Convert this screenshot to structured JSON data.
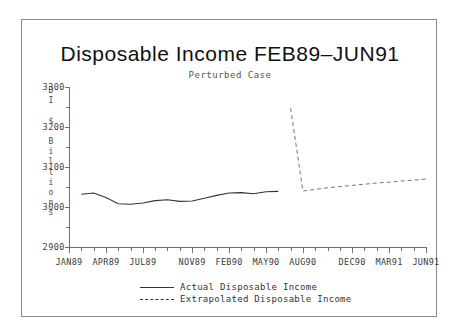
{
  "chart_data": {
    "type": "line",
    "title": "Disposable Income FEB89–JUN91",
    "subtitle": "Perturbed Case",
    "xlabel": "",
    "ylabel": "DI $ Billions",
    "ylabel_chars": [
      "D",
      "I",
      " ",
      "$",
      " ",
      "B",
      "i",
      "l",
      "l",
      "i",
      "o",
      "n",
      "s"
    ],
    "ylim": [
      2900,
      3300
    ],
    "yticks": [
      2900,
      3000,
      3100,
      3200,
      3300
    ],
    "ytick_labels": [
      "2900",
      "3000",
      "3100",
      "3200",
      "3300"
    ],
    "y_minor_step": 50,
    "grid": false,
    "legend_position": "below-axes",
    "xtick_labels": [
      "JAN89",
      "APR89",
      "JUL89",
      "NOV89",
      "FEB90",
      "MAY90",
      "AUG90",
      "DEC90",
      "MAR91",
      "JUN91"
    ],
    "x_range": [
      "JAN89",
      "JUN91"
    ],
    "x_tick_count": 30,
    "series": [
      {
        "name": "Actual Disposable Income",
        "style": "solid",
        "color": "#333333",
        "x": [
          "FEB89",
          "MAR89",
          "APR89",
          "MAY89",
          "JUN89",
          "JUL89",
          "AUG89",
          "SEP89",
          "OCT89",
          "NOV89",
          "DEC89",
          "JAN90",
          "FEB90",
          "MAR90",
          "APR90",
          "MAY90",
          "JUN90"
        ],
        "values": [
          3032,
          3035,
          3024,
          3008,
          3007,
          3010,
          3016,
          3018,
          3014,
          3015,
          3022,
          3029,
          3035,
          3036,
          3033,
          3038,
          3039
        ]
      },
      {
        "name": "Extrapolated Disposable Income",
        "style": "dashed",
        "color": "#666666",
        "x": [
          "JUL90",
          "AUG90",
          "SEP90",
          "OCT90",
          "NOV90",
          "DEC90",
          "JAN91",
          "FEB91",
          "MAR91",
          "APR91",
          "MAY91",
          "JUN91"
        ],
        "values": [
          3247,
          3040,
          3044,
          3048,
          3051,
          3054,
          3057,
          3060,
          3062,
          3065,
          3067,
          3070
        ]
      }
    ],
    "legend_entries": [
      {
        "label": "Actual Disposable Income",
        "style": "solid"
      },
      {
        "label": "Extrapolated Disposable Income",
        "style": "dashed"
      }
    ]
  }
}
